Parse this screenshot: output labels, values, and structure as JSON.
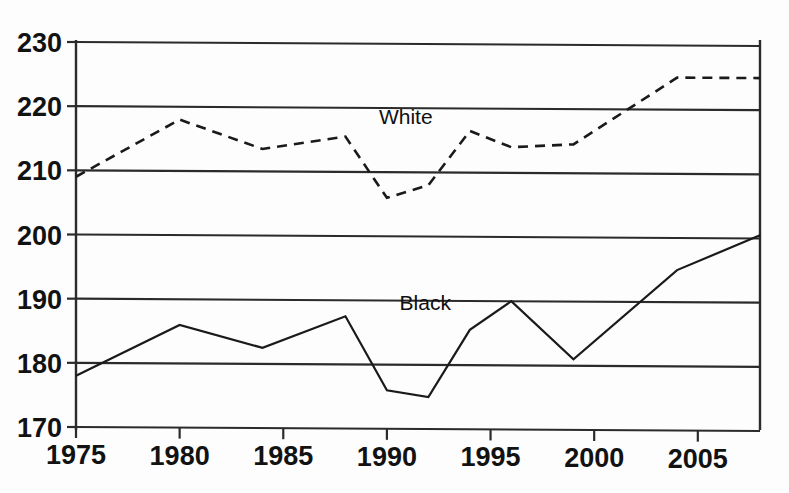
{
  "chart_data": {
    "type": "line",
    "title": "",
    "subtitle": "",
    "xlabel": "",
    "ylabel": "",
    "xlim": [
      1975,
      2008
    ],
    "ylim": [
      170,
      230
    ],
    "grid": true,
    "grid_axis": "y",
    "legend": "inline-labels",
    "x_ticks": [
      1975,
      1980,
      1985,
      1990,
      1995,
      2000,
      2005
    ],
    "x_tick_labels": [
      "1975",
      "1980",
      "1985",
      "1990",
      "1995",
      "2000",
      "2005"
    ],
    "y_ticks": [
      170,
      180,
      190,
      200,
      210,
      220,
      230
    ],
    "y_tick_labels": [
      "170",
      "180",
      "190",
      "200",
      "210",
      "220",
      "230"
    ],
    "series": [
      {
        "name": "White",
        "style": "dashed",
        "label_x": 1990,
        "label_y": 217.5,
        "x": [
          1975,
          1980,
          1984,
          1988,
          1990,
          1992,
          1994,
          1996,
          1999,
          2004,
          2008
        ],
        "values": [
          209,
          218,
          213.5,
          215.5,
          206,
          208,
          216.5,
          214,
          214.5,
          225,
          225
        ]
      },
      {
        "name": "Black",
        "style": "solid",
        "label_x": 1991,
        "label_y": 188.5,
        "x": [
          1975,
          1980,
          1984,
          1988,
          1990,
          1992,
          1994,
          1996,
          1999,
          2004,
          2008
        ],
        "values": [
          178,
          186,
          182.5,
          187.5,
          176,
          175,
          185.5,
          190,
          181,
          195,
          200.5
        ]
      }
    ]
  },
  "axis": {
    "y_labels": [
      "230",
      "220",
      "210",
      "200",
      "190",
      "180",
      "170"
    ],
    "x_labels": [
      "1975",
      "1980",
      "1985",
      "1990",
      "1995",
      "2000",
      "2005"
    ]
  },
  "labels": {
    "white": "White",
    "black": "Black"
  },
  "colors": {
    "ink": "#1a1a1a",
    "grid": "#2b2b2b",
    "background": "#fdfdfd"
  }
}
